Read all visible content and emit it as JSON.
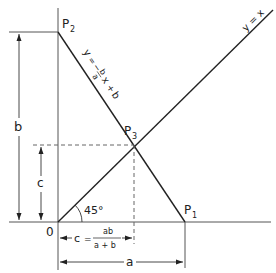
{
  "diagram": {
    "points": {
      "origin": "0",
      "p1": {
        "main": "P",
        "sub": "1"
      },
      "p2": {
        "main": "P",
        "sub": "2"
      },
      "p3": {
        "main": "P",
        "sub": "3"
      }
    },
    "lines": {
      "diagonal_label": "y = x",
      "descending_label": "y = − b/a x + b",
      "descending_parts": {
        "y": "y",
        "eq": "=",
        "minus": "−",
        "num": "b",
        "den": "a",
        "x": "x",
        "plus": "+",
        "b": "b"
      }
    },
    "angle_label": "45°",
    "dimensions": {
      "b": "b",
      "c": "c",
      "a": "a",
      "c_formula": {
        "lhs": "c",
        "eq": "=",
        "num": "ab",
        "den": "a + b"
      }
    },
    "colors": {
      "line": "#222222",
      "axis": "#555555",
      "dashed": "#666666"
    }
  }
}
